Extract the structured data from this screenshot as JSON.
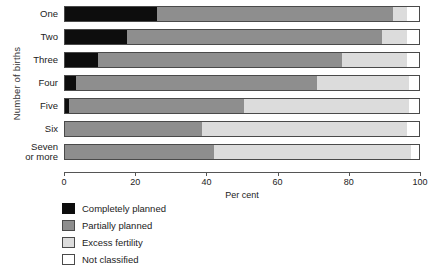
{
  "chart_data": {
    "type": "bar",
    "orientation": "horizontal",
    "stacked": true,
    "stacked_normalized": true,
    "title": "",
    "xlabel": "Per cent",
    "ylabel": "Number of births",
    "xlim": [
      0,
      100
    ],
    "xticks": [
      0,
      20,
      40,
      60,
      80,
      100
    ],
    "xtick_labels": [
      "0",
      "20",
      "40",
      "60",
      "80",
      "100"
    ],
    "grid": false,
    "legend_position": "below-left",
    "categories": [
      "One",
      "Two",
      "Three",
      "Four",
      "Five",
      "Six",
      "Seven or more"
    ],
    "category_labels_wrapped": [
      [
        "One"
      ],
      [
        "Two"
      ],
      [
        "Three"
      ],
      [
        "Four"
      ],
      [
        "Five"
      ],
      [
        "Six"
      ],
      [
        "Seven",
        "or more"
      ]
    ],
    "series": [
      {
        "name": "Completely planned",
        "color": "#0d0d0d",
        "values": [
          26.1,
          17.7,
          9.6,
          3.4,
          1.5,
          0.0,
          0.0
        ]
      },
      {
        "name": "Partially planned",
        "color": "#8e8e8e",
        "values": [
          66.3,
          71.6,
          68.4,
          67.6,
          49.0,
          38.8,
          42.0
        ]
      },
      {
        "name": "Excess fertility",
        "color": "#dcdcdc",
        "values": [
          3.9,
          7.0,
          18.3,
          26.0,
          46.5,
          57.5,
          55.5
        ]
      },
      {
        "name": "Not classified",
        "color": "#ffffff",
        "values": [
          3.7,
          3.7,
          3.7,
          3.0,
          3.0,
          3.7,
          2.5
        ]
      }
    ],
    "cumulative_boundaries": [
      [
        26.1,
        92.4,
        96.3,
        100
      ],
      [
        17.7,
        89.3,
        96.3,
        100
      ],
      [
        9.6,
        78.0,
        96.3,
        100
      ],
      [
        3.4,
        71.0,
        97.0,
        100
      ],
      [
        1.5,
        50.5,
        97.0,
        100
      ],
      [
        0.0,
        38.8,
        96.3,
        100
      ],
      [
        0.0,
        42.0,
        97.5,
        100
      ]
    ]
  },
  "legend": {
    "items": [
      {
        "label": "Completely planned",
        "swatch": "completely"
      },
      {
        "label": "Partially  planned",
        "swatch": "partially"
      },
      {
        "label": "Excess fertility",
        "swatch": "excess"
      },
      {
        "label": "Not classified",
        "swatch": "notclass"
      }
    ]
  }
}
